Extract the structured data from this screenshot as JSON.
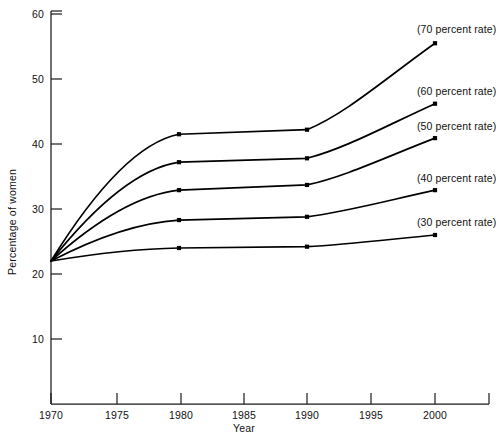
{
  "chart_data": {
    "type": "line",
    "title": "",
    "xlabel": "Year",
    "ylabel": "Percentage of women",
    "x": [
      1970,
      1980,
      1990,
      2000
    ],
    "xlim": [
      1970,
      2003
    ],
    "ylim": [
      0,
      62
    ],
    "xticks": [
      1970,
      1975,
      1980,
      1985,
      1990,
      1995,
      2000
    ],
    "xtick_labels": [
      "1970",
      "1975",
      "1980",
      "1985",
      "1990",
      "1995",
      "2000"
    ],
    "yticks": [
      10,
      20,
      30,
      40,
      50,
      60
    ],
    "ytick_labels": [
      "10",
      "20",
      "30",
      "40",
      "50",
      "60"
    ],
    "grid": false,
    "legend_position": "right-inline-annotations",
    "series": [
      {
        "name": "(70 percent rate)",
        "label": "(70 percent rate)",
        "values": [
          22.0,
          41.5,
          42.2,
          55.5
        ],
        "color": "#000000"
      },
      {
        "name": "(60 percent rate)",
        "label": "(60 percent rate)",
        "values": [
          22.0,
          37.2,
          37.8,
          46.2
        ],
        "color": "#000000"
      },
      {
        "name": "(50 percent rate)",
        "label": "(50 percent rate)",
        "values": [
          22.0,
          32.9,
          33.7,
          40.9
        ],
        "color": "#000000"
      },
      {
        "name": "(40 percent rate)",
        "label": "(40 percent rate)",
        "values": [
          22.0,
          28.3,
          28.8,
          32.9
        ],
        "color": "#000000"
      },
      {
        "name": "(30 percent rate)",
        "label": "(30 percent rate)",
        "values": [
          22.0,
          24.0,
          24.2,
          26.0
        ],
        "color": "#000000"
      }
    ]
  },
  "axis": {
    "y_title": "Percentage of women",
    "x_title": "Year",
    "ytick_0": "10",
    "ytick_1": "20",
    "ytick_2": "30",
    "ytick_3": "40",
    "ytick_4": "50",
    "ytick_5": "60",
    "xtick_0": "1970",
    "xtick_1": "1975",
    "xtick_2": "1980",
    "xtick_3": "1985",
    "xtick_4": "1990",
    "xtick_5": "1995",
    "xtick_6": "2000"
  },
  "annotations": {
    "s70": "(70 percent rate)",
    "s60": "(60 percent rate)",
    "s50": "(50 percent rate)",
    "s40": "(40 percent rate)",
    "s30": "(30 percent rate)"
  }
}
